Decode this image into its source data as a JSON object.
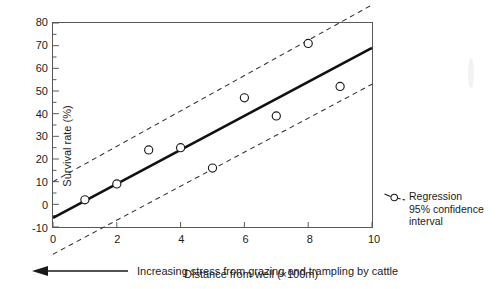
{
  "chart_data": {
    "type": "scatter",
    "title": "",
    "xlabel": "Distance from well (×100m)",
    "ylabel": "Survival rate (%)",
    "xlim": [
      0,
      10
    ],
    "ylim": [
      -10,
      80
    ],
    "xticks": [
      "0",
      "2",
      "4",
      "6",
      "8",
      "10"
    ],
    "xtick_values": [
      0,
      2,
      4,
      6,
      8,
      10
    ],
    "yticks": [
      "-10",
      "0",
      "10",
      "20",
      "30",
      "40",
      "50",
      "60",
      "70",
      "80"
    ],
    "ytick_values": [
      -10,
      0,
      10,
      20,
      30,
      40,
      50,
      60,
      70,
      80
    ],
    "grid": false,
    "minor_ticks": true,
    "points": [
      {
        "x": 1,
        "y": 2
      },
      {
        "x": 2,
        "y": 9
      },
      {
        "x": 3,
        "y": 24
      },
      {
        "x": 4,
        "y": 25
      },
      {
        "x": 5,
        "y": 16
      },
      {
        "x": 6,
        "y": 47
      },
      {
        "x": 7,
        "y": 39
      },
      {
        "x": 8,
        "y": 71
      },
      {
        "x": 9,
        "y": 52
      }
    ],
    "series": [
      {
        "name": "Regression",
        "style": "solid",
        "x": [
          0,
          10
        ],
        "values": [
          -6,
          69
        ]
      },
      {
        "name": "95% confidence interval upper",
        "style": "dashed",
        "x": [
          0,
          10
        ],
        "values": [
          10,
          88
        ]
      },
      {
        "name": "95% confidence interval lower",
        "style": "dashed",
        "x": [
          0,
          10
        ],
        "values": [
          -22,
          53
        ]
      }
    ],
    "legend_position": "right",
    "legend": [
      {
        "symbol": "circle-with-dashes",
        "lines": [
          "Regression",
          "95% confidence",
          "interval"
        ]
      }
    ],
    "annotations": [
      {
        "text": "Increasing stress from grazing and trampling by cattle",
        "arrow": "left-arrow",
        "position": "below-x-axis"
      }
    ],
    "colors": {
      "axis": "#55595c",
      "regression_line": "#111111",
      "confidence_line": "#333333",
      "marker_stroke": "#1a1a1a",
      "marker_fill": "#ffffff",
      "text": "#1c1c1c"
    }
  }
}
